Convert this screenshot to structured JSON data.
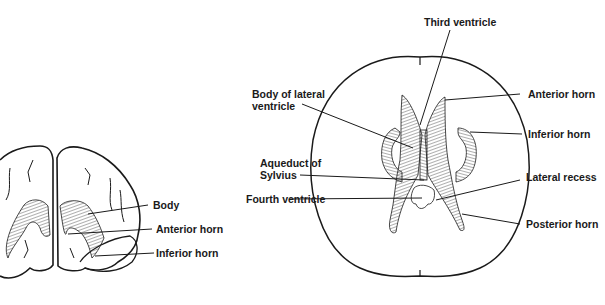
{
  "figure_left": {
    "view": "coronal",
    "labels": {
      "body": "Body",
      "anterior_horn": "Anterior horn",
      "inferior_horn": "Inferior horn"
    }
  },
  "figure_right": {
    "view": "axial",
    "labels": {
      "third_ventricle": "Third ventricle",
      "body_of_lateral_ventricle": "Body of lateral\nventricle",
      "anterior_horn": "Anterior horn",
      "inferior_horn": "Inferior horn",
      "aqueduct_of_sylvius": "Aqueduct of\nSylvius",
      "lateral_recess": "Lateral recess",
      "fourth_ventricle": "Fourth ventricle",
      "posterior_horn": "Posterior horn"
    }
  },
  "colors": {
    "ink": "#1a1a1a",
    "background": "#ffffff"
  }
}
